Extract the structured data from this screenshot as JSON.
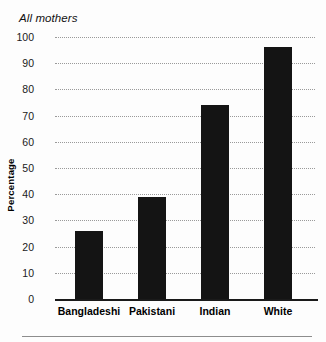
{
  "chart_data": {
    "type": "bar",
    "title": "All mothers",
    "xlabel": "",
    "ylabel": "Percentage",
    "ylim": [
      0,
      100
    ],
    "yticks": [
      0,
      10,
      20,
      30,
      40,
      50,
      60,
      70,
      80,
      90,
      100
    ],
    "ytick_labels": [
      "0",
      "10",
      "20",
      "30",
      "40",
      "50",
      "60",
      "70",
      "80",
      "90",
      "100"
    ],
    "grid": true,
    "legend": "none",
    "categories": [
      "Bangladeshi",
      "Pakistani",
      "Indian",
      "White"
    ],
    "values": [
      26,
      39,
      74,
      96
    ],
    "bar_color": "#141414",
    "gridline_color": "#9a9a9a",
    "axis_color": "#1a1a1a"
  },
  "figure": {
    "title": "All mothers",
    "y_axis_label": "Percentage"
  }
}
